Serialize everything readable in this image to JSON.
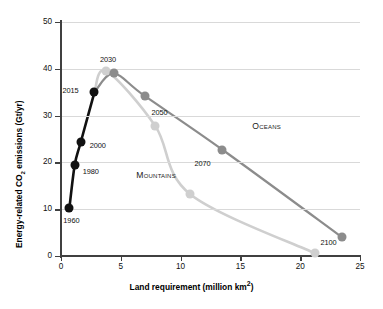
{
  "chart_data": {
    "type": "line",
    "title": "",
    "xlabel": "Land requirement (million km²)",
    "ylabel": "Energy-related CO2 emissions (Gt/yr)",
    "ylabel_rich": {
      "pre": "Energy-related CO",
      "sub": "2",
      "post": " emissions (Gt/yr)"
    },
    "xlabel_rich": {
      "pre": "Land requirement (million km",
      "sup": "2",
      "post": ")"
    },
    "xlim": [
      0,
      25
    ],
    "ylim": [
      0,
      50
    ],
    "xticks": [
      0,
      5,
      10,
      15,
      20,
      25
    ],
    "yticks": [
      0,
      10,
      20,
      30,
      40,
      50
    ],
    "grid": "horizontal",
    "legend": "inline-annotations",
    "series": [
      {
        "name": "Historical",
        "color": "#111111",
        "points": [
          {
            "label": "1960",
            "x": 0.7,
            "y": 10.2
          },
          {
            "label": "1980",
            "x": 1.15,
            "y": 19.5
          },
          {
            "label": "2000",
            "x": 1.65,
            "y": 24.3
          },
          {
            "label": "2015",
            "x": 2.8,
            "y": 35.0
          }
        ]
      },
      {
        "name": "Oceans",
        "color": "#8c8c8c",
        "points": [
          {
            "label": "2030",
            "x": 4.4,
            "y": 39.0
          },
          {
            "label": "2050",
            "x": 7.0,
            "y": 34.2
          },
          {
            "label": "2070",
            "x": 13.5,
            "y": 22.7
          },
          {
            "label": "2100",
            "x": 23.5,
            "y": 4.0
          }
        ]
      },
      {
        "name": "Mountains",
        "color": "#cfcfcf",
        "points": [
          {
            "label": "2030",
            "x": 3.8,
            "y": 39.5
          },
          {
            "label": "2050",
            "x": 7.9,
            "y": 27.7
          },
          {
            "label": "2070",
            "x": 10.8,
            "y": 13.2
          },
          {
            "label": "2100",
            "x": 21.2,
            "y": 0.6
          }
        ]
      }
    ],
    "annotations": [
      {
        "text": "1960",
        "x": 0.7,
        "y": 10.2,
        "dx": -6,
        "dy": 13
      },
      {
        "text": "1980",
        "x": 1.15,
        "y": 19.5,
        "dx": 8,
        "dy": 7
      },
      {
        "text": "2000",
        "x": 1.65,
        "y": 24.3,
        "dx": 9,
        "dy": 4
      },
      {
        "text": "2015",
        "x": 2.8,
        "y": 35.0,
        "dx": -32,
        "dy": -1
      },
      {
        "text": "2030",
        "x": 4.1,
        "y": 39.5,
        "dx": -10,
        "dy": -11
      },
      {
        "text": "2050",
        "x": 7.9,
        "y": 27.7,
        "dx": -4,
        "dy": -13
      },
      {
        "text": "2070",
        "x": 13.5,
        "y": 22.7,
        "dx": -28,
        "dy": 14
      },
      {
        "text": "2100",
        "x": 21.2,
        "y": 0.6,
        "dx": 6,
        "dy": -10
      }
    ],
    "series_labels": [
      {
        "text": "Oceans",
        "x": 16.0,
        "y": 27.5
      },
      {
        "text": "Mountains",
        "x": 6.3,
        "y": 17.0
      }
    ]
  }
}
